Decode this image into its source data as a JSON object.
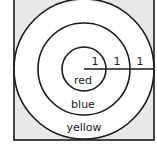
{
  "diagram": {
    "square": {
      "x": 14,
      "y": -2,
      "width": 140,
      "height": 142,
      "corner_fill": "#e8e8e8",
      "stroke": "#1a1a1a"
    },
    "center": {
      "x": 84,
      "y": 69
    },
    "rings": [
      {
        "name": "red",
        "label": "red",
        "radius": 22,
        "label_x": 83,
        "label_y": 84
      },
      {
        "name": "blue",
        "label": "blue",
        "radius": 46,
        "label_x": 83,
        "label_y": 108
      },
      {
        "name": "yellow",
        "label": "yellow",
        "radius": 70,
        "label_x": 84,
        "label_y": 131
      }
    ],
    "radius_line": {
      "x1": 84,
      "y1": 69,
      "x2": 154,
      "y2": 69
    },
    "segment_labels": [
      {
        "text": "1",
        "x": 95,
        "y": 65
      },
      {
        "text": "1",
        "x": 117,
        "y": 65
      },
      {
        "text": "1",
        "x": 140,
        "y": 65
      }
    ],
    "stroke_color": "#1a1a1a",
    "fill_inside": "#ffffff"
  }
}
